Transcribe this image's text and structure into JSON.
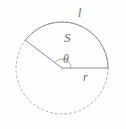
{
  "figure": {
    "kind": "circle-sector-geometry-diagram",
    "background_color": "#fefefe",
    "stroke_color": "#9a9a9a",
    "label_color": "#6b6b6b",
    "circle": {
      "center_x": 62,
      "center_y": 68,
      "radius": 46,
      "full_circle_style": "dashed",
      "sector_style": "solid"
    },
    "sector": {
      "start_angle_deg": 0,
      "end_angle_deg": 143,
      "sweep_deg": 143,
      "radius_line_1": {
        "x1": 62,
        "y1": 68,
        "x2": 108,
        "y2": 68
      },
      "radius_line_2": {
        "x1": 62,
        "y1": 68,
        "x2": 25,
        "y2": 41
      }
    },
    "angle_arc": {
      "radius": 9,
      "description": "small arc marking central angle theta at the vertex"
    },
    "labels": {
      "arc_length": "l",
      "area": "S",
      "angle": "θ",
      "radius": "r"
    }
  }
}
